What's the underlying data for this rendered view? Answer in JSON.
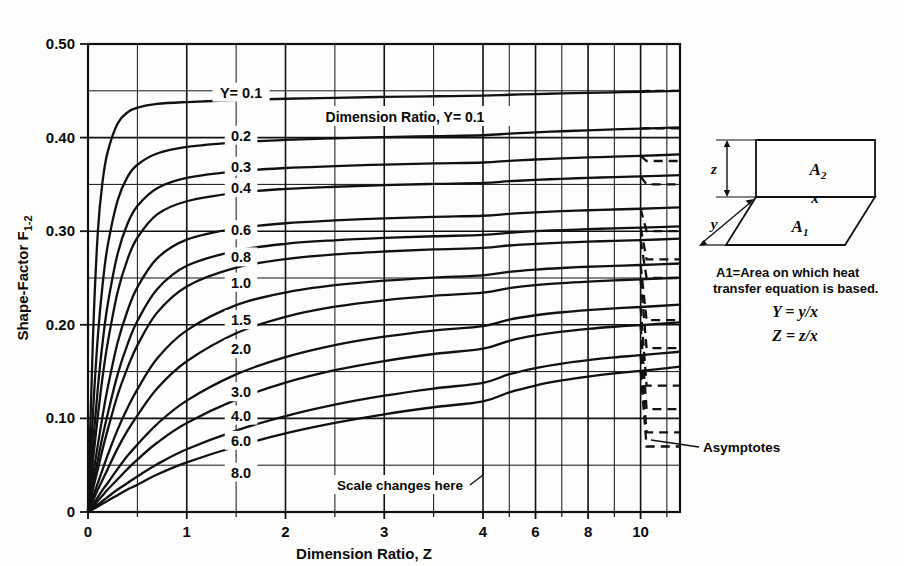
{
  "figure": {
    "background_color": "#fdfdfb",
    "ink_color": "#111111"
  },
  "axes": {
    "x_title": "Dimension Ratio, Z",
    "y_title": "Shape-Factor F",
    "y_title_sub": "1-2",
    "x_tick_labels": [
      "0",
      "1.0",
      "2.0",
      "3.0",
      "4.0",
      "6",
      "8",
      "10"
    ],
    "y_tick_labels": [
      "0",
      "0.10",
      "0.20",
      "0.30",
      "0.40",
      "0.50"
    ],
    "scale_change_note": "Scale changes here",
    "asymptotes_note": "Asymptotes",
    "top_note": "Dimension Ratio, Y= 0.1"
  },
  "legend": {
    "area_note_line1": "A1=Area on which heat",
    "area_note_line2": "transfer equation is based.",
    "eq_y": "Y = y/x",
    "eq_z": "Z = z/x",
    "label_a1": "A1",
    "label_a2": "A2",
    "label_x": "x",
    "label_y": "y",
    "label_z": "z"
  },
  "chart_data": {
    "type": "line",
    "title": "",
    "xlabel": "Dimension Ratio, Z",
    "ylabel": "Shape-Factor F(1-2)",
    "xlim": [
      0,
      11.5
    ],
    "ylim": [
      0,
      0.5
    ],
    "x_major_ticks": [
      0,
      1.0,
      2.0,
      3.0,
      4.0,
      6,
      8,
      10
    ],
    "x_minor_ticks": [
      0.5,
      1.5,
      2.5,
      3.5,
      5,
      7,
      9,
      11
    ],
    "y_major_ticks": [
      0,
      0.1,
      0.2,
      0.3,
      0.4,
      0.5
    ],
    "y_minor_ticks": [
      0.05,
      0.15,
      0.25,
      0.35,
      0.45
    ],
    "grid": true,
    "legend_position": "inline-curve-labels",
    "x_axis_break_at": 4.0,
    "series_parameter_name": "Y",
    "series": [
      {
        "name": "0.1",
        "asymptote": 0.45,
        "x": [
          0,
          0.05,
          0.1,
          0.15,
          0.2,
          0.3,
          0.4,
          0.5,
          0.7,
          1.0,
          1.5,
          2.0,
          2.5,
          3.0,
          3.5,
          4.0,
          5,
          6,
          7,
          8,
          9,
          10,
          11.5
        ],
        "values": [
          0,
          0.185,
          0.3,
          0.355,
          0.385,
          0.415,
          0.427,
          0.432,
          0.436,
          0.438,
          0.44,
          0.4415,
          0.4425,
          0.4435,
          0.4442,
          0.4448,
          0.4458,
          0.4465,
          0.4472,
          0.4478,
          0.4484,
          0.449,
          0.45
        ]
      },
      {
        "name": "0.2",
        "asymptote": 0.41,
        "x": [
          0,
          0.05,
          0.1,
          0.15,
          0.2,
          0.3,
          0.4,
          0.5,
          0.7,
          1.0,
          1.5,
          2.0,
          2.5,
          3.0,
          3.5,
          4.0,
          5,
          6,
          7,
          8,
          9,
          10,
          11.5
        ],
        "values": [
          0,
          0.105,
          0.188,
          0.245,
          0.285,
          0.333,
          0.358,
          0.371,
          0.383,
          0.39,
          0.395,
          0.3975,
          0.3992,
          0.4005,
          0.4015,
          0.4025,
          0.4042,
          0.4056,
          0.4068,
          0.4078,
          0.4088,
          0.4096,
          0.411
        ]
      },
      {
        "name": "0.3",
        "asymptote": 0.375,
        "x": [
          0,
          0.05,
          0.1,
          0.15,
          0.2,
          0.3,
          0.4,
          0.5,
          0.7,
          1.0,
          1.5,
          2.0,
          2.5,
          3.0,
          3.5,
          4.0,
          5,
          6,
          7,
          8,
          9,
          10,
          11.5
        ],
        "values": [
          0,
          0.072,
          0.133,
          0.183,
          0.222,
          0.276,
          0.308,
          0.327,
          0.346,
          0.357,
          0.364,
          0.3675,
          0.3695,
          0.3712,
          0.3724,
          0.3734,
          0.3752,
          0.3766,
          0.3778,
          0.3788,
          0.3797,
          0.3805,
          0.382
        ]
      },
      {
        "name": "0.4",
        "asymptote": 0.35,
        "x": [
          0,
          0.05,
          0.1,
          0.15,
          0.2,
          0.3,
          0.4,
          0.5,
          0.7,
          1.0,
          1.5,
          2.0,
          2.5,
          3.0,
          3.5,
          4.0,
          5,
          6,
          7,
          8,
          9,
          10,
          11.5
        ],
        "values": [
          0,
          0.055,
          0.103,
          0.146,
          0.181,
          0.235,
          0.27,
          0.293,
          0.318,
          0.332,
          0.341,
          0.3452,
          0.3475,
          0.3492,
          0.3505,
          0.3516,
          0.3534,
          0.3548,
          0.356,
          0.357,
          0.3578,
          0.3586,
          0.36
        ]
      },
      {
        "name": "0.6",
        "asymptote": 0.3,
        "x": [
          0,
          0.05,
          0.1,
          0.15,
          0.2,
          0.3,
          0.4,
          0.5,
          0.7,
          1.0,
          1.5,
          2.0,
          2.5,
          3.0,
          3.5,
          4.0,
          5,
          6,
          7,
          8,
          9,
          10,
          11.5
        ],
        "values": [
          0,
          0.038,
          0.072,
          0.104,
          0.133,
          0.181,
          0.215,
          0.24,
          0.271,
          0.291,
          0.303,
          0.3085,
          0.3115,
          0.3137,
          0.3153,
          0.3165,
          0.3186,
          0.3202,
          0.3214,
          0.3224,
          0.3232,
          0.324,
          0.3255
        ]
      },
      {
        "name": "0.8",
        "asymptote": 0.27,
        "x": [
          0,
          0.05,
          0.1,
          0.15,
          0.2,
          0.3,
          0.4,
          0.5,
          0.7,
          1.0,
          1.5,
          2.0,
          2.5,
          3.0,
          3.5,
          4.0,
          5,
          6,
          7,
          8,
          9,
          10,
          11.5
        ],
        "values": [
          0,
          0.029,
          0.056,
          0.082,
          0.105,
          0.147,
          0.179,
          0.204,
          0.238,
          0.263,
          0.279,
          0.2865,
          0.2903,
          0.2928,
          0.2946,
          0.296,
          0.2983,
          0.3,
          0.3012,
          0.3022,
          0.303,
          0.3038,
          0.3052
        ]
      },
      {
        "name": "1.0",
        "asymptote": 0.25,
        "x": [
          0,
          0.05,
          0.1,
          0.15,
          0.2,
          0.3,
          0.4,
          0.5,
          0.7,
          1.0,
          1.5,
          2.0,
          2.5,
          3.0,
          3.5,
          4.0,
          5,
          6,
          7,
          8,
          9,
          10,
          11.5
        ],
        "values": [
          0,
          0.024,
          0.046,
          0.068,
          0.088,
          0.125,
          0.154,
          0.178,
          0.213,
          0.241,
          0.261,
          0.2702,
          0.2752,
          0.2783,
          0.2805,
          0.2821,
          0.2847,
          0.2865,
          0.2878,
          0.2888,
          0.2897,
          0.2905,
          0.292
        ]
      },
      {
        "name": "1.5",
        "asymptote": 0.205,
        "x": [
          0,
          0.05,
          0.1,
          0.15,
          0.2,
          0.3,
          0.4,
          0.5,
          0.7,
          1.0,
          1.5,
          2.0,
          2.5,
          3.0,
          3.5,
          4.0,
          5,
          6,
          7,
          8,
          9,
          10,
          11.5
        ],
        "values": [
          0,
          0.016,
          0.031,
          0.046,
          0.061,
          0.088,
          0.111,
          0.131,
          0.164,
          0.194,
          0.221,
          0.2345,
          0.2423,
          0.2472,
          0.2505,
          0.2529,
          0.2566,
          0.259,
          0.2607,
          0.262,
          0.263,
          0.2639,
          0.2655
        ]
      },
      {
        "name": "2.0",
        "asymptote": 0.175,
        "x": [
          0,
          0.05,
          0.1,
          0.15,
          0.2,
          0.3,
          0.4,
          0.5,
          0.7,
          1.0,
          1.5,
          2.0,
          2.5,
          3.0,
          3.5,
          4.0,
          5,
          6,
          7,
          8,
          9,
          10,
          11.5
        ],
        "values": [
          0,
          0.012,
          0.024,
          0.035,
          0.046,
          0.068,
          0.087,
          0.103,
          0.132,
          0.161,
          0.191,
          0.2085,
          0.2193,
          0.2262,
          0.2309,
          0.2343,
          0.2392,
          0.2424,
          0.2446,
          0.2462,
          0.2475,
          0.2486,
          0.2505
        ]
      },
      {
        "name": "3.0",
        "asymptote": 0.135,
        "x": [
          0,
          0.05,
          0.1,
          0.15,
          0.2,
          0.3,
          0.4,
          0.5,
          0.7,
          1.0,
          1.5,
          2.0,
          2.5,
          3.0,
          3.5,
          4.0,
          5,
          6,
          7,
          8,
          9,
          10,
          11.5
        ],
        "values": [
          0,
          0.008,
          0.016,
          0.024,
          0.031,
          0.046,
          0.06,
          0.072,
          0.094,
          0.119,
          0.147,
          0.1655,
          0.1783,
          0.1873,
          0.1938,
          0.1987,
          0.2056,
          0.2102,
          0.2134,
          0.2157,
          0.2175,
          0.219,
          0.2215
        ]
      },
      {
        "name": "4.0",
        "asymptote": 0.11,
        "x": [
          0,
          0.05,
          0.1,
          0.15,
          0.2,
          0.3,
          0.4,
          0.5,
          0.7,
          1.0,
          1.5,
          2.0,
          2.5,
          3.0,
          3.5,
          4.0,
          5,
          6,
          7,
          8,
          9,
          10,
          11.5
        ],
        "values": [
          0,
          0.006,
          0.012,
          0.018,
          0.024,
          0.035,
          0.046,
          0.056,
          0.074,
          0.095,
          0.12,
          0.1382,
          0.1515,
          0.1613,
          0.1688,
          0.1745,
          0.1829,
          0.1886,
          0.1926,
          0.1956,
          0.1979,
          0.1997,
          0.2025
        ]
      },
      {
        "name": "6.0",
        "asymptote": 0.085,
        "x": [
          0,
          0.05,
          0.1,
          0.15,
          0.2,
          0.3,
          0.4,
          0.5,
          0.7,
          1.0,
          1.5,
          2.0,
          2.5,
          3.0,
          3.5,
          4.0,
          5,
          6,
          7,
          8,
          9,
          10,
          11.5
        ],
        "values": [
          0,
          0.004,
          0.008,
          0.012,
          0.016,
          0.024,
          0.031,
          0.038,
          0.051,
          0.067,
          0.087,
          0.1025,
          0.1147,
          0.1243,
          0.1319,
          0.138,
          0.1472,
          0.1538,
          0.1586,
          0.1623,
          0.1652,
          0.1675,
          0.1712
        ]
      },
      {
        "name": "8.0",
        "asymptote": 0.07,
        "x": [
          0,
          0.05,
          0.1,
          0.15,
          0.2,
          0.3,
          0.4,
          0.5,
          0.7,
          1.0,
          1.5,
          2.0,
          2.5,
          3.0,
          3.5,
          4.0,
          5,
          6,
          7,
          8,
          9,
          10,
          11.5
        ],
        "values": [
          0,
          0.003,
          0.006,
          0.009,
          0.012,
          0.018,
          0.024,
          0.029,
          0.04,
          0.053,
          0.07,
          0.0839,
          0.0951,
          0.1043,
          0.1119,
          0.1182,
          0.1279,
          0.1351,
          0.1405,
          0.1447,
          0.1481,
          0.1508,
          0.1552
        ]
      }
    ],
    "curve_label_column_x": 1.55,
    "curve_labels": [
      {
        "text": "Y= 0.1",
        "y": 0.448
      },
      {
        "text": "0.2",
        "y": 0.402
      },
      {
        "text": "0.3",
        "y": 0.369
      },
      {
        "text": "0.4",
        "y": 0.346
      },
      {
        "text": "0.6",
        "y": 0.301
      },
      {
        "text": "0.8",
        "y": 0.272
      },
      {
        "text": "1.0",
        "y": 0.245
      },
      {
        "text": "1.5",
        "y": 0.205
      },
      {
        "text": "2.0",
        "y": 0.174
      },
      {
        "text": "3.0",
        "y": 0.128
      },
      {
        "text": "4.0",
        "y": 0.103
      },
      {
        "text": "6.0",
        "y": 0.076
      },
      {
        "text": "8.0",
        "y": 0.042
      }
    ]
  }
}
